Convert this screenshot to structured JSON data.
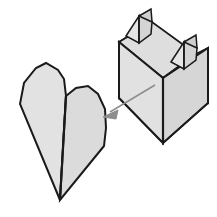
{
  "diagram": {
    "title": "Paper folding step: collapse pleated form into flat heart shape",
    "type": "origami-fold-step",
    "background_color": "#ffffff",
    "canvas": {
      "width": 217,
      "height": 217
    }
  },
  "style": {
    "paper_fill_light": "#e4e4e4",
    "paper_fill_mid": "#dcdcdc",
    "paper_fill_shade": "#d2d2d2",
    "paper_fill_dark": "#c9c9c9",
    "paper_fill_deep": "#bfbfbf",
    "outline_color": "#1a1a1a",
    "fold_color": "#2b2b2b",
    "thin_fold_color": "#555555",
    "arrow_color": "#8d8d8d",
    "outline_width": 2.0,
    "fold_width": 1.6,
    "thin_width": 0.9,
    "arrow_width": 1.4
  },
  "shapes": {
    "result_flat": {
      "label": "flat folded heart shape (result)",
      "outline": "20,104 24,83 36,68 46,63 58,70 64,79 66,96 76,88 88,86 98,94 105,109 106,128 104,146 60,200 20,104",
      "center_fold": "66,96 60,200",
      "left_lobe": "20,104 24,83 36,68 46,63 58,70 64,79 66,96 60,200",
      "right_lobe": "66,96 76,88 88,86 98,94 105,109 106,128 104,146 60,200"
    },
    "pleated_form": {
      "label": "pleated three-dimensional form (before)",
      "front_left_panel": "119,42 119,98 163,143 163,78",
      "front_right_panel": "163,78 163,143 208,103 208,48",
      "back_left_panel": "119,42 152,22 152,73 119,98",
      "top_face_left": "119,42 152,22 196,54 163,78",
      "top_face_right": "163,78 196,54 208,48 208,103",
      "left_peak_front": "127,35 139,16 151,22 139,43",
      "left_peak_back": "139,16 151,9 151,22",
      "left_peak_inner": "139,43 139,16 151,22",
      "right_peak_front": "172,62 185,42 196,48 184,69",
      "right_peak_back": "185,42 196,35 196,48",
      "right_peak_inner": "184,69 185,42 196,48",
      "ridge_center": "163,78 163,143",
      "diagonal_fold": "119,98 163,143",
      "diagonal_fold_right": "208,103 163,143"
    },
    "arrow": {
      "label": "motion arrow indicating collapse direction",
      "shaft": "155,85 110,112",
      "head": "103,117 118,110 116,119",
      "direction": "down-left"
    }
  }
}
